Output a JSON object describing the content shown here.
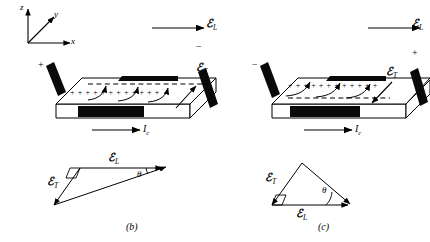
{
  "figure": {
    "type": "physics-diagram",
    "axes": {
      "z_label": "z",
      "y_label": "y",
      "x_label": "x"
    },
    "panels": [
      {
        "id": "b",
        "caption": "(b)",
        "slab": {
          "longitudinal_field_label": "ℰ",
          "longitudinal_field_sub": "L",
          "transverse_field_label": "ℰ",
          "transverse_field_sub": "T",
          "current_label": "I",
          "current_sub": "c",
          "top_edge_charge": "− − − − − − − − − − − −",
          "front_edge_charge": "+ + + + + + + + + + + +",
          "left_side_sign": "+",
          "right_side_sign": "−",
          "transverse_arrow_direction": "up-right",
          "field_line_direction": "upward-curving"
        },
        "triangle": {
          "hyp_label": "ℰ",
          "hyp_sub": "T",
          "base_label": "ℰ",
          "base_sub": "L",
          "angle_label": "θ",
          "right_angle": true,
          "base_position": "top",
          "base_arrow_direction": "right",
          "transverse_arrow_direction": "down-left"
        }
      },
      {
        "id": "c",
        "caption": "(c)",
        "slab": {
          "longitudinal_field_label": "ℰ",
          "longitudinal_field_sub": "L",
          "transverse_field_label": "ℰ",
          "transverse_field_sub": "T",
          "current_label": "I",
          "current_sub": "c",
          "top_edge_charge": "+ + + + + + + + + + + +",
          "front_edge_charge": "− − − − − − − − − − − −",
          "left_side_sign": "−",
          "right_side_sign": "+",
          "transverse_arrow_direction": "down-right",
          "field_line_direction": "upward-curving"
        },
        "triangle": {
          "hyp_label": "ℰ",
          "hyp_sub": "T",
          "base_label": "ℰ",
          "base_sub": "L",
          "angle_label": "θ",
          "right_angle": true,
          "base_position": "bottom",
          "base_arrow_direction": "right",
          "transverse_arrow_direction": "down-left"
        }
      }
    ],
    "colors": {
      "ink": "#000000",
      "paper": "#ffffff",
      "electrode": "#0a0a0a",
      "slab_face": "#fefefe"
    }
  }
}
